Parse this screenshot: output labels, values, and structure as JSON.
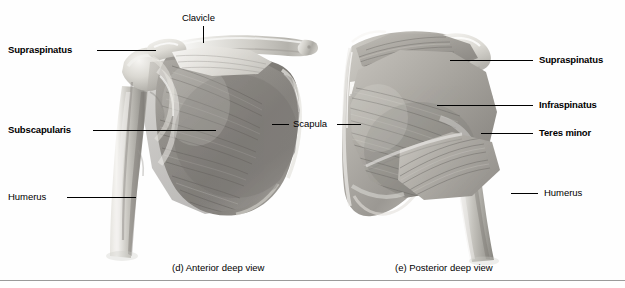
{
  "figure": {
    "background_color": "#fefefe",
    "rule_color": "#9a9a9a",
    "leader_color": "#000000"
  },
  "panels": [
    {
      "id": "anterior",
      "caption": "(d) Anterior deep view",
      "labels": [
        {
          "name": "supraspinatus",
          "text": "Supraspinatus",
          "bold": true,
          "side": "left"
        },
        {
          "name": "subscapularis",
          "text": "Subscapularis",
          "bold": true,
          "side": "left"
        },
        {
          "name": "humerus",
          "text": "Humerus",
          "bold": false,
          "side": "left"
        },
        {
          "name": "clavicle",
          "text": "Clavicle",
          "bold": false,
          "side": "top"
        },
        {
          "name": "scapula",
          "text": "Scapula",
          "bold": false,
          "side": "right"
        }
      ]
    },
    {
      "id": "posterior",
      "caption": "(e) Posterior deep view",
      "labels": [
        {
          "name": "supraspinatus",
          "text": "Supraspinatus",
          "bold": true,
          "side": "right"
        },
        {
          "name": "infraspinatus",
          "text": "Infraspinatus",
          "bold": true,
          "side": "right"
        },
        {
          "name": "teres-minor",
          "text": "Teres minor",
          "bold": true,
          "side": "right"
        },
        {
          "name": "humerus",
          "text": "Humerus",
          "bold": false,
          "side": "right"
        }
      ]
    }
  ],
  "anterior": {
    "label_supraspinatus": "Supraspinatus",
    "label_subscapularis": "Subscapularis",
    "label_humerus": "Humerus",
    "label_clavicle": "Clavicle",
    "label_scapula": "Scapula",
    "caption": "(d) Anterior deep view"
  },
  "posterior": {
    "label_supraspinatus": "Supraspinatus",
    "label_infraspinatus": "Infraspinatus",
    "label_teres_minor": "Teres minor",
    "label_humerus": "Humerus",
    "caption": "(e) Posterior deep view"
  }
}
